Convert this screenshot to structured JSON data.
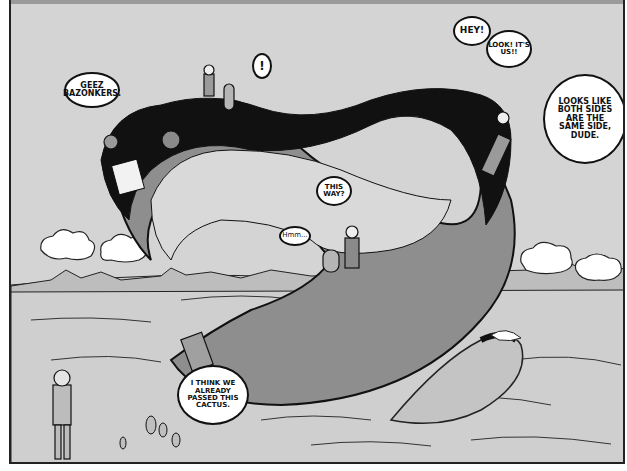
{
  "panel": {
    "description": "Comic panel: characters walking on a giant Möbius strip floating over a desert",
    "colors": {
      "sky": "#d4d4d4",
      "strip_dark_side": "#111111",
      "strip_grey_side": "#8e8e8e",
      "ground": "#cfcfcf",
      "cloud": "#ffffff",
      "ink": "#111111"
    }
  },
  "speech_bubbles": [
    {
      "id": "geez",
      "text": "GEEZ BAZONKERS."
    },
    {
      "id": "exclaim",
      "text": "!"
    },
    {
      "id": "hey",
      "text": "HEY!"
    },
    {
      "id": "look",
      "text": "LOOK! IT'S US!!"
    },
    {
      "id": "both-sides",
      "text": "LOOKS LIKE BOTH SIDES ARE THE SAME SIDE, DUDE."
    },
    {
      "id": "this-way",
      "text": "THIS WAY?"
    },
    {
      "id": "hmm",
      "text": "Hmm..."
    },
    {
      "id": "cactus",
      "text": "I THINK WE ALREADY PASSED THIS CACTUS."
    }
  ]
}
